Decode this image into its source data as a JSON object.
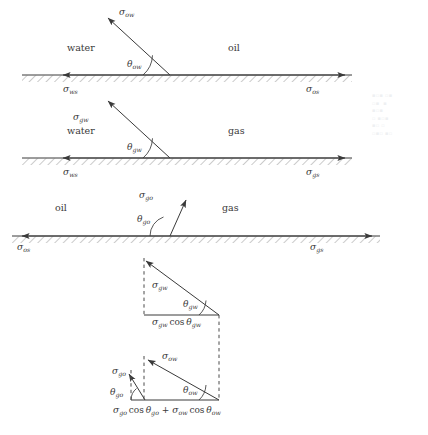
{
  "figure": {
    "type": "vector-force-balance-diagram",
    "panels": [
      {
        "id": "oil-water",
        "left_phase": "water",
        "right_phase": "oil",
        "vector_label": "σ",
        "vector_sub": "ow",
        "angle_label": "θ",
        "angle_sub": "ow",
        "left_axis_label": "σ",
        "left_axis_sub": "ws",
        "right_axis_label": "σ",
        "right_axis_sub": "os",
        "angle_deg": 40
      },
      {
        "id": "gas-water",
        "left_phase": "water",
        "right_phase": "gas",
        "vector_label": "σ",
        "vector_sub": "gw",
        "angle_label": "θ",
        "angle_sub": "gw",
        "left_axis_label": "σ",
        "left_axis_sub": "ws",
        "right_axis_label": "σ",
        "right_axis_sub": "gs",
        "angle_deg": 40
      },
      {
        "id": "gas-oil",
        "left_phase": "oil",
        "right_phase": "gas",
        "vector_label": "σ",
        "vector_sub": "go",
        "angle_label": "θ",
        "angle_sub": "go",
        "left_axis_label": "σ",
        "left_axis_sub": "os",
        "right_axis_label": "σ",
        "right_axis_sub": "gs",
        "angle_deg": 65
      }
    ],
    "composition": {
      "upper": {
        "vector_label": "σ",
        "vector_sub": "gw",
        "angle_label": "θ",
        "angle_sub": "gw",
        "base_sym1": "σ",
        "base_sub1": "gw",
        "base_op": "cos",
        "base_sym2": "θ",
        "base_sub2": "gw"
      },
      "lower": {
        "vector1_label": "σ",
        "vector1_sub": "ow",
        "angle1_label": "θ",
        "angle1_sub": "ow",
        "vector2_label": "σ",
        "vector2_sub": "go",
        "angle2_label": "θ",
        "angle2_sub": "go",
        "base_sym1": "σ",
        "base_sub1": "go",
        "base_op1": "cos",
        "base_sym2": "θ",
        "base_sub2": "go",
        "base_plus": "+",
        "base_sym3": "σ",
        "base_sub3": "ow",
        "base_op2": "cos",
        "base_sym4": "θ",
        "base_sub4": "ow"
      }
    },
    "colors": {
      "line": "#3a3a3a",
      "hatch": "#8f8f8f",
      "dash": "#4a4a4a",
      "text": "#3a3a3a",
      "background": "#ffffff"
    }
  }
}
